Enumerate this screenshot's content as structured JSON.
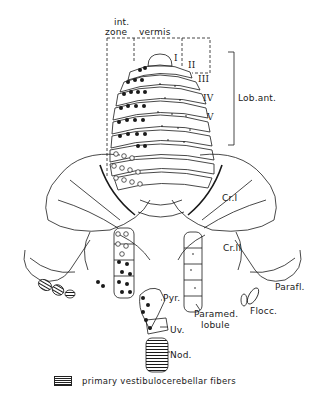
{
  "labels": {
    "int_zone_line1": "int.",
    "int_zone_line2": "zone",
    "vermis": "vermis",
    "lobule_I": "I",
    "lobule_II": "II",
    "lobule_III": "III",
    "lobule_IV": "IV",
    "lobule_V": "V",
    "lob_ant": "Lob.ant.",
    "cr_I": "Cr.I",
    "cr_II": "Cr.II",
    "parafl": "Parafl.",
    "flocc": "Flocc.",
    "paramed_line1": "Paramed.",
    "paramed_line2": "lobule",
    "pyr": "Pyr.",
    "uv": "Uv.",
    "nod": "Nod."
  },
  "legend": {
    "swatch": "horizontal-hatch",
    "text": "primary vestibulocerebellar fibers"
  },
  "colors": {
    "ink": "#1a1a1a",
    "background": "#ffffff"
  }
}
